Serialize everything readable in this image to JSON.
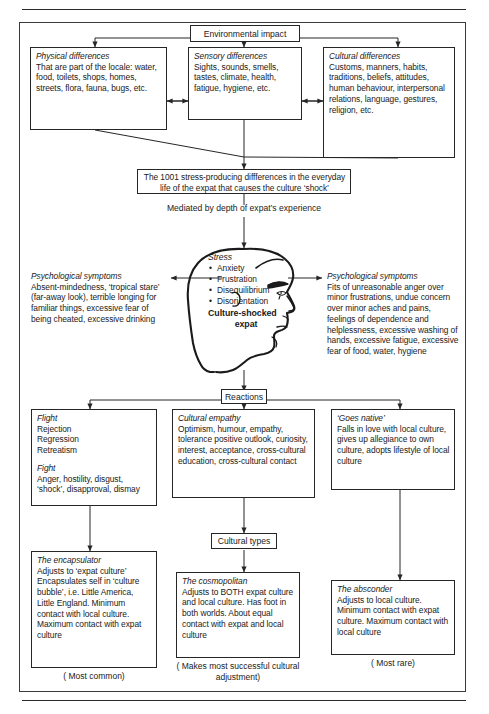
{
  "diagram": {
    "root": {
      "label": "Environmental impact"
    },
    "differences": [
      {
        "heading": "Physical differences",
        "body": "That are part of the locale: water, food, toilets, shops, homes, streets, flora, fauna, bugs, etc."
      },
      {
        "heading": "Sensory differences",
        "body": "Sights, sounds, smells, tastes, climate, health, fatigue, hygiene, etc."
      },
      {
        "heading": "Cultural differences",
        "body": "Customs, manners, habits, traditions, beliefs, attitudes, human behaviour, interpersonal relations, language, gestures, religion, etc."
      }
    ],
    "stressors_box": "The 1001 stress-producing diffferences in the everyday life of the expat that causes the culture ‘shock’",
    "mediator_text": "Mediated by depth of expat’s experience",
    "head": {
      "stress_heading": "Stress",
      "stress_items": [
        "Anxiety",
        "Frustration",
        "Disequilibrium",
        "Disorientation"
      ],
      "label_line1": "Culture-shocked",
      "label_line2": "expat"
    },
    "symptoms_left": {
      "heading": "Psychological symptoms",
      "body": "Absent-mindedness, ‘tropical stare’ (far-away look), terrible longing for familiar things, excessive fear of being cheated, excessive drinking"
    },
    "symptoms_right": {
      "heading": "Psychological symptoms",
      "body": "Fits of unreasonable anger over minor frustrations, undue concern over minor aches and pains, feelings of dependence and helplessness, excessive washing of hands, excessive fatigue, excessive fear of food, water, hygiene"
    },
    "reactions": {
      "label": "Reactions"
    },
    "reaction_boxes": [
      {
        "heading1": "Flight",
        "list": [
          "Rejection",
          "Regression",
          "Retreatism"
        ],
        "heading2": "Fight",
        "body": "Anger, hostility, disgust, ‘shock’, disapproval, dismay"
      },
      {
        "heading1": "Cultural empathy",
        "body": "Optimism, humour, empathy, tolerance positive outlook, curiosity, interest, acceptance, cross-cultural education, cross-cultural contact"
      },
      {
        "heading1": "‘Goes native’",
        "body": "Falls in love with local culture, gives up allegiance to own culture, adopts lifestyle of local culture"
      }
    ],
    "cultural_types": {
      "label": "Cultural types"
    },
    "types": [
      {
        "heading": "The encapsulator",
        "body": "Adjusts to ‘expat culture’ Encapsulates self in ‘culture bubble’, i.e. Little America, Little England. Minimum contact with local culture. Maximum  contact with expat culture",
        "caption": "( Most common)"
      },
      {
        "heading": "The cosmopolitan",
        "body": "Adjusts to BOTH expat culture and local culture. Has foot in both worlds. About equal contact with expat and local culture",
        "caption": "( Makes most successful cultural adjustment)"
      },
      {
        "heading": "The absconder",
        "body": "Adjusts to local culture. Minimum contact with expat culture. Maximum contact with local culture",
        "caption": "( Most rare)"
      }
    ],
    "colors": {
      "ink": "#262626",
      "paper": "#ffffff"
    }
  }
}
